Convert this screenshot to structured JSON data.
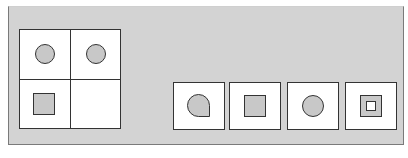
{
  "puzzle": {
    "type": "visual-analogy-matrix",
    "matrix": {
      "rows": 2,
      "cols": 2,
      "cells": [
        {
          "position": "top-left",
          "shape": "circle",
          "fill": "#c8c8c8"
        },
        {
          "position": "top-right",
          "shape": "circle",
          "fill": "#c8c8c8"
        },
        {
          "position": "bottom-left",
          "shape": "square",
          "fill": "#c8c8c8"
        },
        {
          "position": "bottom-right",
          "shape": "empty",
          "fill": "#ffffff"
        }
      ]
    },
    "options": [
      {
        "index": 1,
        "shape": "teardrop"
      },
      {
        "index": 2,
        "shape": "square"
      },
      {
        "index": 3,
        "shape": "circle"
      },
      {
        "index": 4,
        "shape": "nested-square"
      }
    ]
  },
  "colors": {
    "panel_background": "#d3d3d3",
    "cell_background": "#ffffff",
    "shape_fill": "#c8c8c8",
    "stroke": "#333333"
  }
}
